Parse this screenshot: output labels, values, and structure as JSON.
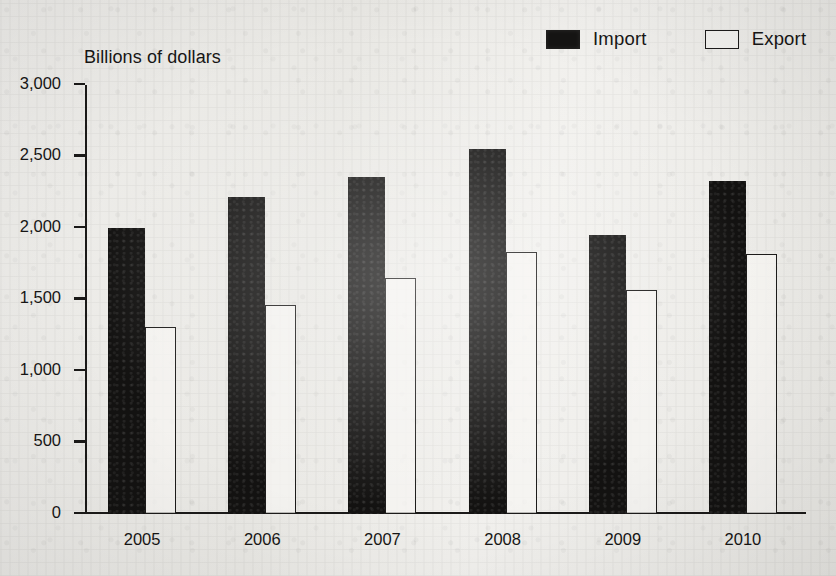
{
  "axis_title": "Billions of dollars",
  "legend": {
    "position": "top-right",
    "entries": [
      {
        "label": "Import",
        "swatch": "filled-dark-square",
        "color": "#131211"
      },
      {
        "label": "Export",
        "swatch": "hollow-outlined-square",
        "color": "#f6f5f2"
      }
    ]
  },
  "chart_data": {
    "type": "bar",
    "title": "",
    "subtitle": "",
    "xlabel": "",
    "ylabel": "Billions of dollars",
    "categories": [
      "2005",
      "2006",
      "2007",
      "2008",
      "2009",
      "2010"
    ],
    "series": [
      {
        "name": "Import",
        "color": "#131211",
        "values": [
          2000,
          2220,
          2360,
          2550,
          1950,
          2330
        ]
      },
      {
        "name": "Export",
        "color": "#f6f5f2",
        "values": [
          1305,
          1460,
          1650,
          1830,
          1565,
          1815
        ]
      }
    ],
    "ylim": [
      0,
      3000
    ],
    "ytick_values": [
      0,
      500,
      1000,
      1500,
      2000,
      2500,
      3000
    ],
    "ytick_labels": [
      "0",
      "500",
      "1,000",
      "1,500",
      "2,000",
      "2,500",
      "3,000"
    ],
    "grid": false,
    "legend_position": "top-right"
  }
}
